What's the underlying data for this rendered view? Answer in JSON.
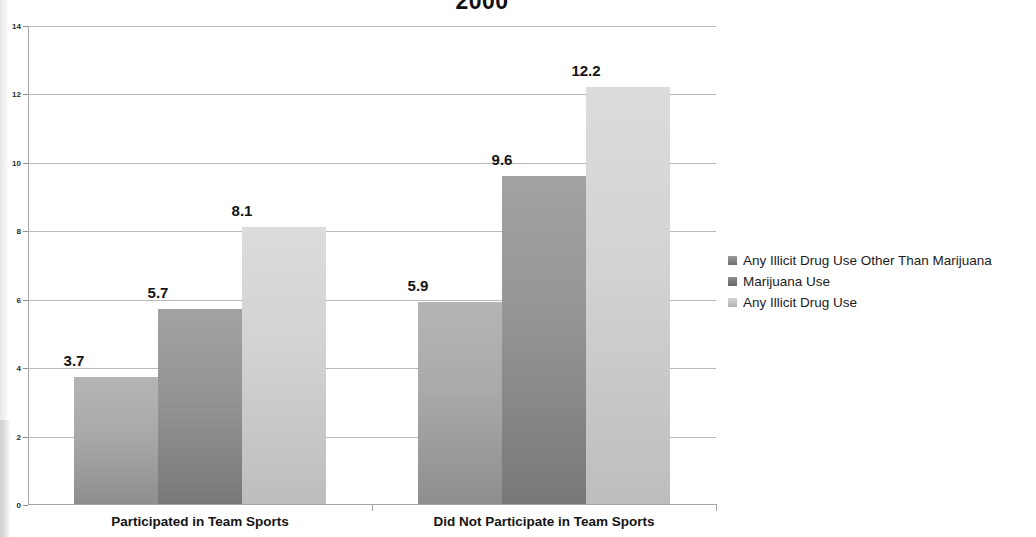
{
  "chart_data": {
    "type": "bar",
    "title": "2000",
    "xlabel": "",
    "ylabel": "",
    "ylim": [
      0,
      14
    ],
    "ytick_labels": [
      "0",
      "2",
      "4",
      "6",
      "8",
      "10",
      "12",
      "14"
    ],
    "yticks": [
      0,
      2,
      4,
      6,
      8,
      10,
      12,
      14
    ],
    "grid": true,
    "legend_position": "right",
    "categories": [
      "Participated in Team Sports",
      "Did Not Participate in Team Sports"
    ],
    "series": [
      {
        "name": "Any Illicit Drug Use Other Than Marijuana",
        "color": "#a9a9a9",
        "values": [
          3.7,
          5.9
        ],
        "labels": [
          "3.7",
          "5.9"
        ]
      },
      {
        "name": "Marijuana Use",
        "color": "#949494",
        "values": [
          5.7,
          9.6
        ],
        "labels": [
          "5.7",
          "9.6"
        ]
      },
      {
        "name": "Any Illicit Drug Use",
        "color": "#d2d2d2",
        "values": [
          8.1,
          12.2
        ],
        "labels": [
          "8.1",
          "12.2"
        ]
      }
    ]
  },
  "legend": {
    "items": [
      {
        "label": "Any Illicit Drug Use Other Than Marijuana"
      },
      {
        "label": "Marijuana Use"
      },
      {
        "label": "Any Illicit Drug Use"
      }
    ]
  }
}
